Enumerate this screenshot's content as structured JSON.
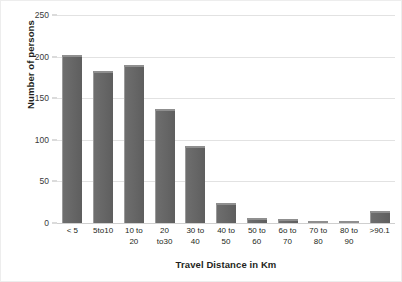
{
  "chart_data": {
    "type": "bar",
    "title": "",
    "xlabel": "Travel Distance in Km",
    "ylabel": "Number of persons",
    "categories": [
      "< 5",
      "5to10",
      "10 to\n20",
      "20\nto30",
      "30 to\n40",
      "40 to\n50",
      "50 to\n60",
      "6o to\n70",
      "70 to\n80",
      "80 to\n90",
      ">90.1"
    ],
    "values": [
      202,
      183,
      190,
      137,
      93,
      24,
      6,
      5,
      2,
      3,
      14
    ],
    "ylim": [
      0,
      250
    ],
    "yticks": [
      0,
      50,
      100,
      150,
      200,
      250
    ],
    "ytick_labels": [
      "0",
      "50",
      "100",
      "150",
      "200",
      "250"
    ],
    "grid": "horizontal",
    "legend": "none",
    "bar_color": "#666666",
    "gridline_color": "#e2e2e2",
    "background_color": "#ffffff"
  }
}
